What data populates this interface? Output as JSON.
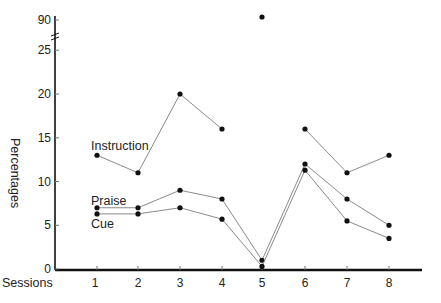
{
  "chart_data": {
    "type": "line",
    "title": "",
    "xlabel": "Sessions",
    "ylabel": "Percentages",
    "categories": [
      "1",
      "2",
      "3",
      "4",
      "5",
      "6",
      "7",
      "8"
    ],
    "x": [
      1,
      2,
      3,
      4,
      5,
      6,
      7,
      8
    ],
    "y_ticks": [
      "0",
      "5",
      "10",
      "15",
      "20",
      "25",
      "90"
    ],
    "ylim": [
      0,
      90
    ],
    "axis_break": "between 25 and 90",
    "grid": false,
    "legend": "inline labels",
    "series": [
      {
        "name": "Instruction",
        "values": [
          13,
          11,
          20,
          16,
          90,
          16,
          11,
          13
        ],
        "note": "session 5 value plotted above axis break, not connected"
      },
      {
        "name": "Praise",
        "values": [
          7,
          7,
          9,
          8,
          1,
          12,
          8,
          5
        ]
      },
      {
        "name": "Cue",
        "values": [
          6.3,
          6.3,
          7,
          5.7,
          0.3,
          11.3,
          5.5,
          3.5
        ]
      }
    ]
  },
  "labels": {
    "xlabel": "Sessions",
    "ylabel": "Percentages",
    "series": {
      "instruction": "Instruction",
      "praise": "Praise",
      "cue": "Cue"
    }
  }
}
